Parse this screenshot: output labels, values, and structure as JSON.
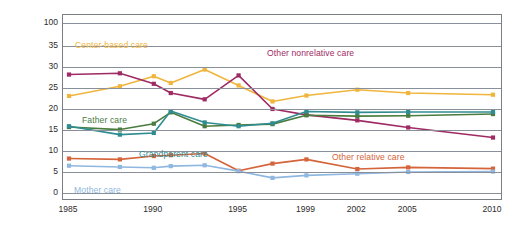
{
  "chart_data": {
    "type": "line",
    "title": "",
    "xlabel": "",
    "ylabel": "Percent",
    "x": [
      1985,
      1988,
      1990,
      1991,
      1993,
      1995,
      1997,
      1999,
      2002,
      2005,
      2010
    ],
    "xticks": [
      "1985",
      "1990",
      "1995",
      "1999",
      "2002",
      "2005",
      "2010"
    ],
    "yticks": [
      "0",
      "5",
      "10",
      "15",
      "20",
      "25",
      "30",
      "35",
      "100"
    ],
    "ylim": [
      0,
      40
    ],
    "grid": true,
    "legend": "inline annotations",
    "series": [
      {
        "name": "Center-based care",
        "color": "#f0b53c",
        "values": [
          23.1,
          25.4,
          27.8,
          26.2,
          29.4,
          25.6,
          21.8,
          23.2,
          24.6,
          23.8,
          23.4
        ]
      },
      {
        "name": "Other nonrelative care",
        "color": "#9e2b63",
        "values": [
          28.2,
          28.5,
          26.0,
          23.8,
          22.3,
          28.0,
          20.0,
          18.6,
          17.3,
          15.6,
          13.2
        ]
      },
      {
        "name": "Father care",
        "color": "#4a7c3f",
        "values": [
          15.7,
          15.1,
          16.5,
          19.2,
          15.9,
          16.2,
          16.4,
          18.5,
          18.3,
          18.4,
          18.8
        ]
      },
      {
        "name": "Grandparent care",
        "color": "#2f8c91",
        "values": [
          15.9,
          13.9,
          14.3,
          19.5,
          16.8,
          15.9,
          16.6,
          19.4,
          19.2,
          19.3,
          19.3
        ]
      },
      {
        "name": "Other relative care",
        "color": "#d4643a",
        "values": [
          8.2,
          8.0,
          8.8,
          9.0,
          9.4,
          5.3,
          7.0,
          8.0,
          5.7,
          6.1,
          5.8
        ]
      },
      {
        "name": "Mother care",
        "color": "#8fb7e0",
        "values": [
          6.5,
          6.2,
          6.0,
          6.4,
          6.6,
          5.2,
          3.6,
          4.2,
          4.6,
          5.0,
          5.1
        ]
      }
    ],
    "annotations": [
      {
        "text": "Center-based care",
        "color": "#f0b53c",
        "x": 75,
        "y": 40
      },
      {
        "text": "Other nonrelative care",
        "color": "#9e2b63",
        "x": 267,
        "y": 48
      },
      {
        "text": "Father care",
        "color": "#4a7c3f",
        "x": 82,
        "y": 115
      },
      {
        "text": "Grandparent care",
        "color": "#2f8c91",
        "x": 139,
        "y": 149
      },
      {
        "text": "Other relative care",
        "color": "#d4643a",
        "x": 332,
        "y": 152
      },
      {
        "text": "Mother care",
        "color": "#8fb7e0",
        "x": 74,
        "y": 185
      }
    ]
  }
}
